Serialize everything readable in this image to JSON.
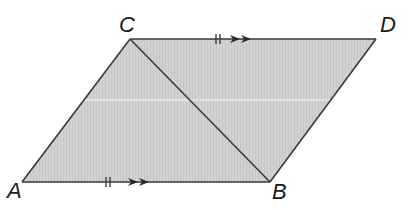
{
  "diagram": {
    "type": "parallelogram",
    "colors": {
      "fill": "#cdcdcd",
      "stroke": "#3a3a3a",
      "label": "#1a1a1a",
      "highlight_line": "#f4f4f4"
    },
    "vertices": {
      "A": {
        "label": "A",
        "x": 22,
        "y": 182
      },
      "B": {
        "label": "B",
        "x": 270,
        "y": 182
      },
      "C": {
        "label": "C",
        "x": 130,
        "y": 39
      },
      "D": {
        "label": "D",
        "x": 376,
        "y": 39
      }
    },
    "edges": [
      {
        "from": "A",
        "to": "B",
        "marks": {
          "ticks": 2,
          "arrows": 2
        }
      },
      {
        "from": "C",
        "to": "D",
        "marks": {
          "ticks": 2,
          "arrows": 2
        }
      },
      {
        "from": "A",
        "to": "C",
        "marks": null
      },
      {
        "from": "B",
        "to": "D",
        "marks": null
      },
      {
        "from": "C",
        "to": "B",
        "marks": null,
        "role": "diagonal"
      }
    ],
    "annotations": {
      "parallel_sides": [
        "AB",
        "CD"
      ],
      "equal_sides": [
        "AB",
        "CD"
      ]
    }
  }
}
